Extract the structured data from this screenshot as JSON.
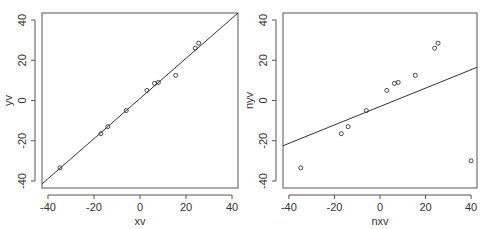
{
  "chart_data": [
    {
      "type": "scatter",
      "title": "",
      "xlabel": "xv",
      "ylabel": "yv",
      "xlim": [
        -42.6,
        42.6
      ],
      "ylim": [
        -43.5,
        43.5
      ],
      "xticks": [
        -40,
        -20,
        0,
        20,
        40
      ],
      "yticks": [
        -40,
        -20,
        0,
        20,
        40
      ],
      "xtick_labels": [
        "-40",
        "-20",
        "0",
        "20",
        "40"
      ],
      "ytick_labels": [
        "-40",
        "-20",
        "0",
        "20",
        "40"
      ],
      "grid": false,
      "points": [
        {
          "x": -34.8,
          "y": -33.5
        },
        {
          "x": -17.0,
          "y": -16.5
        },
        {
          "x": -14.0,
          "y": -13.0
        },
        {
          "x": -6.0,
          "y": -5.0
        },
        {
          "x": 3.0,
          "y": 5.0
        },
        {
          "x": 6.3,
          "y": 8.5
        },
        {
          "x": 8.0,
          "y": 9.0
        },
        {
          "x": 15.5,
          "y": 12.5
        },
        {
          "x": 24.0,
          "y": 26.0
        },
        {
          "x": 25.5,
          "y": 28.5
        }
      ],
      "fit_line": {
        "x1": -42.6,
        "y1": -41.5,
        "x2": 42.6,
        "y2": 43.5
      }
    },
    {
      "type": "scatter",
      "title": "",
      "xlabel": "nxv",
      "ylabel": "nyv",
      "xlim": [
        -42.6,
        42.6
      ],
      "ylim": [
        -43.5,
        43.5
      ],
      "xticks": [
        -40,
        -20,
        0,
        20,
        40
      ],
      "yticks": [
        -40,
        -20,
        0,
        20,
        40
      ],
      "xtick_labels": [
        "-40",
        "-20",
        "0",
        "20",
        "40"
      ],
      "ytick_labels": [
        "-40",
        "-20",
        "0",
        "20",
        "40"
      ],
      "grid": false,
      "points": [
        {
          "x": -34.8,
          "y": -33.5
        },
        {
          "x": -17.0,
          "y": -16.5
        },
        {
          "x": -14.0,
          "y": -13.0
        },
        {
          "x": -6.0,
          "y": -5.0
        },
        {
          "x": 3.0,
          "y": 5.0
        },
        {
          "x": 6.3,
          "y": 8.5
        },
        {
          "x": 8.0,
          "y": 9.0
        },
        {
          "x": 15.5,
          "y": 12.5
        },
        {
          "x": 24.0,
          "y": 26.0
        },
        {
          "x": 25.5,
          "y": 28.5
        },
        {
          "x": 40.0,
          "y": -30.0
        }
      ],
      "fit_line": {
        "x1": -42.6,
        "y1": -22.5,
        "x2": 42.6,
        "y2": 16.5
      }
    }
  ],
  "layout": {
    "panels": [
      {
        "box": {
          "left": 42,
          "top": 13,
          "right": 238,
          "bottom": 188
        }
      },
      {
        "box": {
          "left": 283,
          "top": 13,
          "right": 477,
          "bottom": 188
        }
      }
    ],
    "colors": {
      "axis": "#555555",
      "line": "#333333",
      "point": "#333333"
    }
  }
}
